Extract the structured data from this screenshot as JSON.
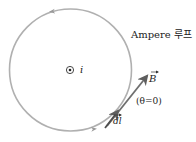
{
  "diagram": {
    "loop_label": "Ampere 루프",
    "current_label": "i",
    "field_vector_label": "B",
    "angle_label": "(θ=0)",
    "length_element_label": "dl",
    "colors": {
      "loop": "#a9a9a9",
      "vector": "#6e6e6e",
      "text": "#222222"
    }
  }
}
